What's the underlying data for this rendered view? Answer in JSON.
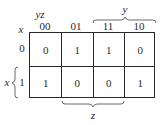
{
  "kmap": {
    "row_var": "x",
    "col_var": "yz",
    "col_headers": [
      "00",
      "01",
      "11",
      "10"
    ],
    "row_headers": [
      "0",
      "1"
    ],
    "cells": [
      [
        "0",
        "1",
        "1",
        "0"
      ],
      [
        "1",
        "0",
        "0",
        "1"
      ]
    ],
    "brace_top_label": "y",
    "brace_bottom_label": "z",
    "brace_left_label": "x"
  }
}
